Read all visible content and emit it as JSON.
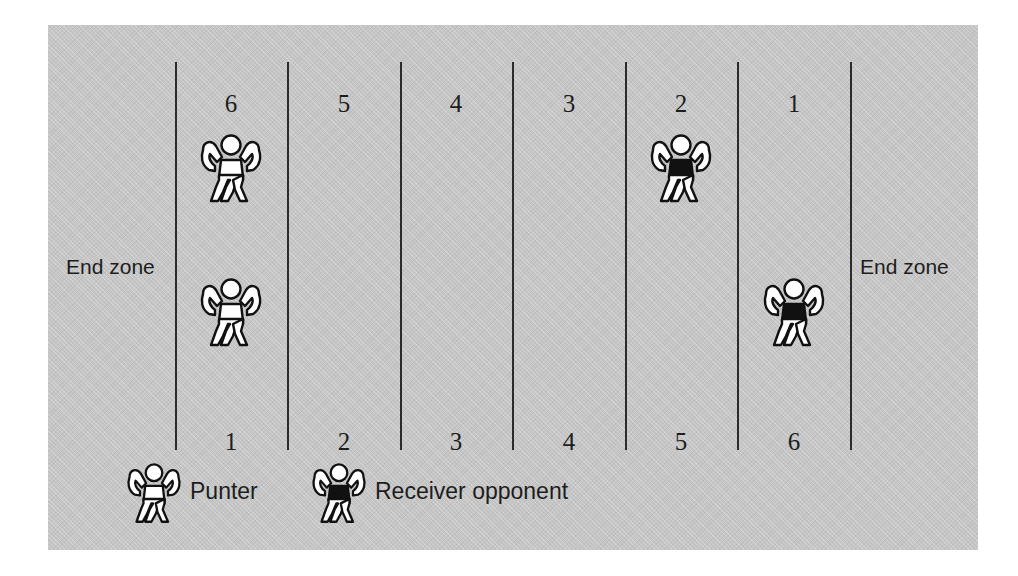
{
  "diagram": {
    "field_color": "#c5c5c5",
    "line_color": "#2b2b2b",
    "text_color": "#1d1d1d"
  },
  "field": {
    "endzone_left_label": "End zone",
    "endzone_right_label": "End zone",
    "yard_numbers_top": [
      "6",
      "5",
      "4",
      "3",
      "2",
      "1"
    ],
    "yard_numbers_bottom": [
      "1",
      "2",
      "3",
      "4",
      "5",
      "6"
    ],
    "yard_line_count": 7
  },
  "players": [
    {
      "name": "punter-top",
      "type": "punter",
      "column": 1,
      "row": "upper"
    },
    {
      "name": "punter-bottom",
      "type": "punter",
      "column": 1,
      "row": "lower"
    },
    {
      "name": "receiver-opponent-top",
      "type": "receiver-opponent",
      "column": 5,
      "row": "upper"
    },
    {
      "name": "receiver-opponent-bottom",
      "type": "receiver-opponent",
      "column": 6,
      "row": "lower"
    }
  ],
  "legend": {
    "punter_label": "Punter",
    "receiver_label": "Receiver opponent",
    "punter_fill": "#ffffff",
    "receiver_fill": "#111111"
  }
}
